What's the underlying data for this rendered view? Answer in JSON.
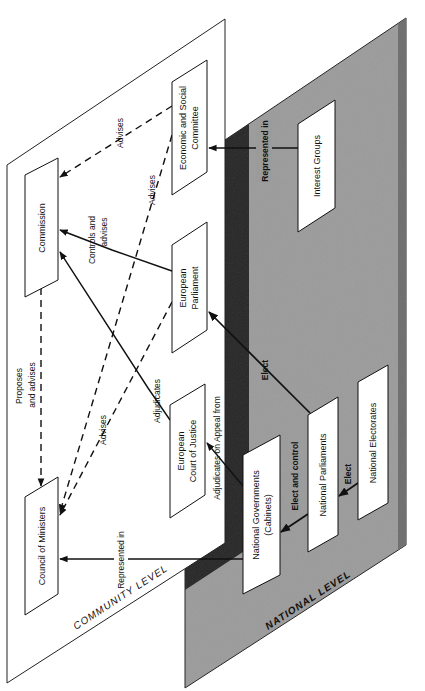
{
  "diagram": {
    "levels": {
      "community": {
        "label": "COMMUNITY LEVEL",
        "fill": "#ffffff"
      },
      "national": {
        "label": "NATIONAL LEVEL",
        "fill": "#9a9a9a",
        "edge_fill": "#2a2a2a"
      }
    },
    "nodes": {
      "commission": {
        "label": "Commission"
      },
      "council": {
        "label": "Council of Ministers"
      },
      "esc": {
        "line1": "Economic and Social",
        "line2": "Committee"
      },
      "parliament": {
        "line1": "European",
        "line2": "Parliament"
      },
      "court": {
        "line1": "European",
        "line2": "Court of  Justice"
      },
      "interest_groups": {
        "label": "Interest  Groups"
      },
      "national_governments": {
        "line1": "National Governments",
        "line2": "(Cabinets)"
      },
      "national_parliaments": {
        "label": "National Parliaments"
      },
      "national_electorates": {
        "label": "National Electorates"
      }
    },
    "edges": {
      "esc_to_commission": {
        "label": "Advises",
        "style": "dashed"
      },
      "esc_to_council": {
        "label": "Advises",
        "style": "dashed"
      },
      "parliament_to_commission": {
        "line1": "Controls and",
        "line2": "advises",
        "style": "solid"
      },
      "parliament_to_council": {
        "label": "Advises",
        "style": "dashed"
      },
      "commission_to_council": {
        "line1": "Proposes",
        "line2": "and advises",
        "style": "dashed"
      },
      "court_to_commission": {
        "label": "Adjudicates",
        "style": "solid"
      },
      "natgov_to_court": {
        "label": "Adjudicates  on  Appeal from",
        "style": "solid"
      },
      "natgov_to_council": {
        "label": "Represented in",
        "style": "solid"
      },
      "interest_to_esc": {
        "label": "Represented in",
        "style": "solid"
      },
      "natparl_to_parliament": {
        "label": "Elect",
        "style": "solid"
      },
      "natparl_to_natgov": {
        "label": "Elect and control",
        "style": "solid"
      },
      "electorates_to_natparl": {
        "label": "Elect",
        "style": "solid"
      }
    }
  }
}
